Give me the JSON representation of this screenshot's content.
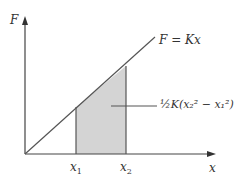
{
  "diagram": {
    "y_axis_label": "F",
    "x_axis_label": "x",
    "line_label": "F = Kx",
    "x1_label": "x",
    "x1_sub": "1",
    "x2_label": "x",
    "x2_sub": "2",
    "area_label": "½K(x₂² − x₁²)",
    "fill_color": "#d4d4d4",
    "line_color": "#555555"
  }
}
